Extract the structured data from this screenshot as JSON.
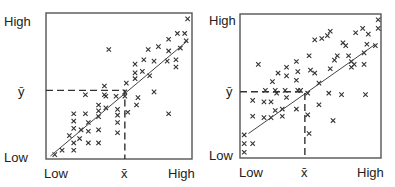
{
  "chart_data": [
    {
      "type": "scatter",
      "title": "",
      "xlabel": "",
      "ylabel": "",
      "x_tick_labels": [
        "Low",
        "x̄",
        "High"
      ],
      "y_tick_labels": [
        "Low",
        "ȳ",
        "High"
      ],
      "xlim": [
        0,
        1
      ],
      "ylim": [
        0,
        1
      ],
      "grid": false,
      "marker": "x",
      "mean": {
        "x": 0.54,
        "y": 0.47,
        "x_label": "x̄",
        "y_label": "ȳ"
      },
      "regression_line": {
        "x0": 0.03,
        "y0": 0.02,
        "x1": 0.97,
        "y1": 0.81
      },
      "correlation": "strong positive",
      "points": [
        [
          0.06,
          0.03
        ],
        [
          0.11,
          0.06
        ],
        [
          0.19,
          0.06
        ],
        [
          0.19,
          0.11
        ],
        [
          0.16,
          0.16
        ],
        [
          0.23,
          0.14
        ],
        [
          0.29,
          0.11
        ],
        [
          0.36,
          0.11
        ],
        [
          0.19,
          0.21
        ],
        [
          0.24,
          0.2
        ],
        [
          0.29,
          0.19
        ],
        [
          0.36,
          0.2
        ],
        [
          0.49,
          0.18
        ],
        [
          0.19,
          0.26
        ],
        [
          0.29,
          0.25
        ],
        [
          0.49,
          0.25
        ],
        [
          0.36,
          0.29
        ],
        [
          0.19,
          0.31
        ],
        [
          0.27,
          0.31
        ],
        [
          0.36,
          0.33
        ],
        [
          0.49,
          0.3
        ],
        [
          0.41,
          0.35
        ],
        [
          0.36,
          0.37
        ],
        [
          0.49,
          0.34
        ],
        [
          0.41,
          0.43
        ],
        [
          0.48,
          0.43
        ],
        [
          0.54,
          0.43
        ],
        [
          0.62,
          0.37
        ],
        [
          0.56,
          0.32
        ],
        [
          0.4,
          0.5
        ],
        [
          0.4,
          0.44
        ],
        [
          0.27,
          0.44
        ],
        [
          0.55,
          0.52
        ],
        [
          0.54,
          0.46
        ],
        [
          0.63,
          0.42
        ],
        [
          0.61,
          0.59
        ],
        [
          0.66,
          0.6
        ],
        [
          0.61,
          0.55
        ],
        [
          0.71,
          0.57
        ],
        [
          0.74,
          0.46
        ],
        [
          0.67,
          0.68
        ],
        [
          0.61,
          0.65
        ],
        [
          0.74,
          0.67
        ],
        [
          0.83,
          0.67
        ],
        [
          0.89,
          0.68
        ],
        [
          0.89,
          0.63
        ],
        [
          0.77,
          0.77
        ],
        [
          0.7,
          0.75
        ],
        [
          0.84,
          0.74
        ],
        [
          0.92,
          0.76
        ],
        [
          0.84,
          0.82
        ],
        [
          0.9,
          0.86
        ],
        [
          0.95,
          0.86
        ],
        [
          0.96,
          0.81
        ],
        [
          0.97,
          0.96
        ],
        [
          0.43,
          0.75
        ],
        [
          0.84,
          0.31
        ]
      ]
    },
    {
      "type": "scatter",
      "title": "",
      "xlabel": "",
      "ylabel": "",
      "x_tick_labels": [
        "Low",
        "x̄",
        "High"
      ],
      "y_tick_labels": [
        "Low",
        "ȳ",
        "High"
      ],
      "xlim": [
        0,
        1
      ],
      "ylim": [
        0,
        1
      ],
      "grid": false,
      "marker": "x",
      "mean": {
        "x": 0.46,
        "y": 0.46,
        "x_label": "x̄",
        "y_label": "ȳ"
      },
      "regression_line": {
        "x0": 0.06,
        "y0": 0.17,
        "x1": 0.96,
        "y1": 0.79
      },
      "correlation": "moderate positive",
      "points": [
        [
          0.03,
          0.04
        ],
        [
          0.03,
          0.1
        ],
        [
          0.03,
          0.16
        ],
        [
          0.09,
          0.1
        ],
        [
          0.09,
          0.29
        ],
        [
          0.09,
          0.4
        ],
        [
          0.17,
          0.28
        ],
        [
          0.17,
          0.39
        ],
        [
          0.22,
          0.28
        ],
        [
          0.22,
          0.39
        ],
        [
          0.26,
          0.45
        ],
        [
          0.25,
          0.47
        ],
        [
          0.3,
          0.29
        ],
        [
          0.3,
          0.34
        ],
        [
          0.32,
          0.47
        ],
        [
          0.33,
          0.42
        ],
        [
          0.23,
          0.53
        ],
        [
          0.33,
          0.57
        ],
        [
          0.33,
          0.63
        ],
        [
          0.27,
          0.59
        ],
        [
          0.18,
          0.47
        ],
        [
          0.4,
          0.34
        ],
        [
          0.41,
          0.47
        ],
        [
          0.4,
          0.54
        ],
        [
          0.43,
          0.47
        ],
        [
          0.41,
          0.6
        ],
        [
          0.4,
          0.67
        ],
        [
          0.5,
          0.61
        ],
        [
          0.49,
          0.17
        ],
        [
          0.48,
          0.45
        ],
        [
          0.48,
          0.3
        ],
        [
          0.49,
          0.71
        ],
        [
          0.53,
          0.59
        ],
        [
          0.56,
          0.52
        ],
        [
          0.56,
          0.37
        ],
        [
          0.63,
          0.45
        ],
        [
          0.66,
          0.26
        ],
        [
          0.64,
          0.62
        ],
        [
          0.67,
          0.68
        ],
        [
          0.69,
          0.71
        ],
        [
          0.72,
          0.44
        ],
        [
          0.75,
          0.78
        ],
        [
          0.77,
          0.71
        ],
        [
          0.79,
          0.67
        ],
        [
          0.79,
          0.63
        ],
        [
          0.81,
          0.65
        ],
        [
          0.88,
          0.65
        ],
        [
          0.88,
          0.73
        ],
        [
          0.89,
          0.44
        ],
        [
          0.9,
          0.79
        ],
        [
          0.91,
          0.86
        ],
        [
          0.96,
          0.78
        ],
        [
          0.98,
          0.9
        ],
        [
          0.98,
          0.96
        ],
        [
          0.62,
          0.85
        ],
        [
          0.64,
          0.88
        ],
        [
          0.53,
          0.82
        ],
        [
          0.73,
          0.8
        ],
        [
          0.87,
          0.9
        ],
        [
          0.58,
          0.83
        ],
        [
          0.25,
          0.33
        ],
        [
          0.13,
          0.65
        ],
        [
          0.82,
          0.87
        ]
      ]
    }
  ],
  "panels": [
    {
      "y_high": "High",
      "y_mean": "ȳ",
      "y_low": "Low",
      "x_low": "Low",
      "x_mean": "x̄",
      "x_high": "High"
    },
    {
      "y_high": "High",
      "y_mean": "ȳ",
      "y_low": "Low",
      "x_low": "Low",
      "x_mean": "x̄",
      "x_high": "High"
    }
  ]
}
